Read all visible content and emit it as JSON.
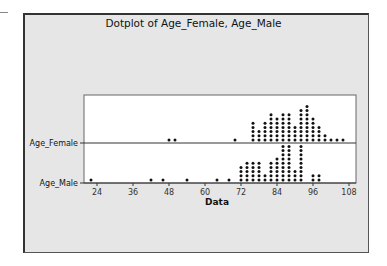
{
  "chart": {
    "title": "Dotplot of Age_Female, Age_Male",
    "xlabel": "Data"
  },
  "colors": {
    "frame_bg": "#e6e6e6",
    "plot_bg": "#ffffff",
    "dot": "#111111"
  },
  "chart_data": {
    "type": "scatter",
    "subtype": "dotplot",
    "title": "Dotplot of Age_Female, Age_Male",
    "xlabel": "Data",
    "ylabel": "",
    "xlim": [
      20,
      108
    ],
    "xticks": [
      24,
      36,
      48,
      60,
      72,
      84,
      96,
      108
    ],
    "grid": false,
    "series": [
      {
        "name": "Age_Female",
        "bins": [
          {
            "x": 48,
            "count": 1
          },
          {
            "x": 50,
            "count": 1
          },
          {
            "x": 70,
            "count": 1
          },
          {
            "x": 76,
            "count": 5
          },
          {
            "x": 78,
            "count": 3
          },
          {
            "x": 80,
            "count": 5
          },
          {
            "x": 82,
            "count": 7
          },
          {
            "x": 84,
            "count": 6
          },
          {
            "x": 86,
            "count": 7
          },
          {
            "x": 88,
            "count": 7
          },
          {
            "x": 90,
            "count": 4
          },
          {
            "x": 92,
            "count": 8
          },
          {
            "x": 94,
            "count": 9
          },
          {
            "x": 96,
            "count": 6
          },
          {
            "x": 98,
            "count": 4
          },
          {
            "x": 100,
            "count": 2
          },
          {
            "x": 102,
            "count": 1
          },
          {
            "x": 104,
            "count": 1
          },
          {
            "x": 106,
            "count": 1
          }
        ]
      },
      {
        "name": "Age_Male",
        "bins": [
          {
            "x": 22,
            "count": 1
          },
          {
            "x": 42,
            "count": 1
          },
          {
            "x": 46,
            "count": 1
          },
          {
            "x": 54,
            "count": 1
          },
          {
            "x": 64,
            "count": 1
          },
          {
            "x": 68,
            "count": 1
          },
          {
            "x": 72,
            "count": 4
          },
          {
            "x": 74,
            "count": 5
          },
          {
            "x": 76,
            "count": 5
          },
          {
            "x": 78,
            "count": 5
          },
          {
            "x": 80,
            "count": 2
          },
          {
            "x": 82,
            "count": 5
          },
          {
            "x": 84,
            "count": 6
          },
          {
            "x": 86,
            "count": 9
          },
          {
            "x": 88,
            "count": 9
          },
          {
            "x": 90,
            "count": 3
          },
          {
            "x": 92,
            "count": 9
          },
          {
            "x": 96,
            "count": 2
          },
          {
            "x": 98,
            "count": 2
          }
        ]
      }
    ]
  }
}
